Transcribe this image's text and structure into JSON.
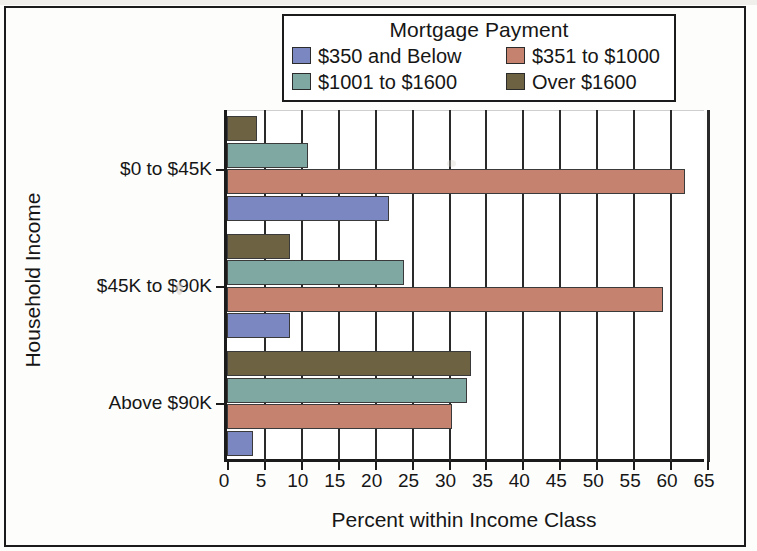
{
  "chart_data": {
    "type": "bar",
    "orientation": "horizontal",
    "title": "",
    "xlabel": "Percent within Income Class",
    "ylabel": "Household Income",
    "legend_title": "Mortgage Payment",
    "legend_position": "top",
    "grid": true,
    "xlim": [
      0,
      65
    ],
    "xticks": [
      0,
      5,
      10,
      15,
      20,
      25,
      30,
      35,
      40,
      45,
      50,
      55,
      60,
      65
    ],
    "categories": [
      "$0 to $45K",
      "$45K to $90K",
      "Above $90K"
    ],
    "series": [
      {
        "name": "$350 and Below",
        "color": "#7b87c0",
        "values": [
          22.0,
          8.5,
          3.5
        ]
      },
      {
        "name": "$351 to $1000",
        "color": "#c4826f",
        "values": [
          62.0,
          59.0,
          30.5
        ]
      },
      {
        "name": "$1001 to $1600",
        "color": "#80a8a2",
        "values": [
          11.0,
          24.0,
          32.5
        ]
      },
      {
        "name": "Over $1600",
        "color": "#6d6342",
        "values": [
          4.0,
          8.5,
          33.0
        ]
      }
    ]
  },
  "axis": {
    "x_title": "Percent within Income Class",
    "y_title": "Household Income",
    "x_tick_labels": [
      "0",
      "5",
      "10",
      "15",
      "20",
      "25",
      "30",
      "35",
      "40",
      "45",
      "50",
      "55",
      "60",
      "65"
    ],
    "y_category_labels": [
      "$0 to $45K",
      "$45K to $90K",
      "Above $90K"
    ]
  },
  "legend": {
    "title": "Mortgage Payment",
    "entries": [
      {
        "label": "$350 and Below",
        "color": "#7b87c0"
      },
      {
        "label": "$351 to $1000",
        "color": "#c4826f"
      },
      {
        "label": "$1001 to $1600",
        "color": "#80a8a2"
      },
      {
        "label": "Over $1600",
        "color": "#6d6342"
      }
    ]
  }
}
